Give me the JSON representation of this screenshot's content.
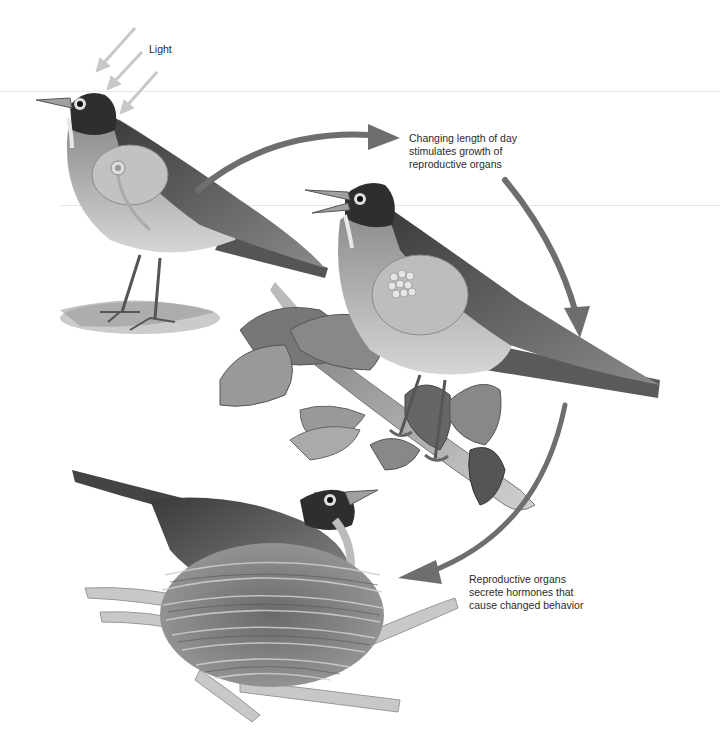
{
  "figure": {
    "labels": {
      "light": "Light",
      "stage1": {
        "lines": [
          "Changing length of day",
          "stimulates growth of",
          "reproductive organs"
        ]
      },
      "stage2": {
        "lines": [
          "Reproductive organs",
          "secrete hormones that",
          "cause changed behavior"
        ]
      }
    },
    "panels": [
      {
        "id": "bird-standing",
        "description": "Robin standing on ground receiving light; small reproductive organ shown on side"
      },
      {
        "id": "bird-singing",
        "description": "Robin singing on leafy branch; enlarged reproductive organs shown on side"
      },
      {
        "id": "bird-nesting",
        "description": "Robin sitting on nest in branches"
      }
    ],
    "colors": {
      "arrow": "#6e6e6e",
      "light_arrow": "#c8c8c8",
      "text": "#2a2a2a",
      "background": "#ffffff"
    }
  }
}
